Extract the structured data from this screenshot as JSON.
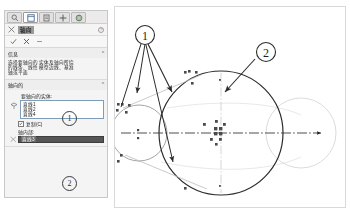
{
  "app": {
    "panel_title": "轴向",
    "help_icon": "help-icon"
  },
  "tabs": [
    {
      "name": "tab-property-manager",
      "icon": "magnifier-icon",
      "active": false
    },
    {
      "name": "tab-feature-manager",
      "icon": "tree-icon",
      "active": true
    },
    {
      "name": "tab-configuration-manager",
      "icon": "config-icon",
      "active": false
    },
    {
      "name": "tab-dimxpert-manager",
      "icon": "move-icon",
      "active": false
    },
    {
      "name": "tab-display-manager",
      "icon": "globe-icon",
      "active": false
    }
  ],
  "actions": [
    {
      "name": "accept-button",
      "icon": "check-icon",
      "label": "确定"
    },
    {
      "name": "cancel-button",
      "icon": "x-icon",
      "label": "取消"
    },
    {
      "name": "detach-button",
      "icon": "pin-icon",
      "label": "固定"
    }
  ],
  "info_section": {
    "title": "信息",
    "collapse_icon": "chevron-up-icon",
    "lines": [
      "选择要轴向的实体及轴向所绕",
      "的线条、线性模型边线、基准",
      "轴或平面"
    ]
  },
  "axis_section": {
    "title": "轴向的",
    "collapse_icon": "chevron-up-icon",
    "entities_label": "要轴向的实体:",
    "selection_icon": "selection-face-icon",
    "entities": [
      "直线1",
      "直线2",
      "直线4"
    ],
    "checkbox": {
      "label": "复制(C)",
      "checked": true,
      "icon": "checkmark-icon"
    },
    "about_label": "轴内部:",
    "about_icon": "axis-icon",
    "about_value": "直线3"
  },
  "callouts": [
    {
      "name": "callout-1",
      "label": "①",
      "text": "1"
    },
    {
      "name": "callout-2",
      "label": "②",
      "text": "2"
    }
  ],
  "canvas": {
    "name": "cad-drawing-canvas",
    "elements": [
      {
        "name": "main-circle",
        "type": "circle"
      },
      {
        "name": "source-circle",
        "type": "circle"
      },
      {
        "name": "preview-circle",
        "type": "circle"
      },
      {
        "name": "centerline",
        "type": "dash-dot-line"
      },
      {
        "name": "vertical-centerline",
        "type": "dash-dot-line"
      },
      {
        "name": "tangent-line-upper",
        "type": "line"
      },
      {
        "name": "tangent-line-lower",
        "type": "line"
      },
      {
        "name": "selection-handles",
        "type": "handle-cluster"
      }
    ]
  }
}
